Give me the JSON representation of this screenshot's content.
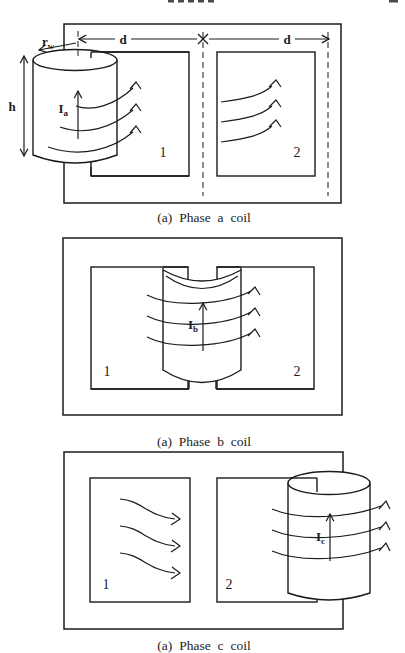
{
  "page": {
    "background": "#ffffff",
    "ink_color": "#1b1b1b"
  },
  "figure": {
    "panels": [
      {
        "id": "phase-a",
        "caption": "(a) Phase a coil",
        "coil_current": {
          "base": "I",
          "sub": "a"
        },
        "pole_left": "1",
        "pole_right": "2",
        "dim_d_left": "d",
        "dim_d_right": "d",
        "dim_height": "h",
        "dim_radius": {
          "base": "r",
          "sub": "w"
        }
      },
      {
        "id": "phase-b",
        "caption": "(a) Phase b coil",
        "coil_current": {
          "base": "I",
          "sub": "b"
        },
        "pole_left": "1",
        "pole_right": "2"
      },
      {
        "id": "phase-c",
        "caption": "(a) Phase c coil",
        "coil_current": {
          "base": "I",
          "sub": "c"
        },
        "pole_left": "1",
        "pole_right": "2"
      }
    ]
  }
}
